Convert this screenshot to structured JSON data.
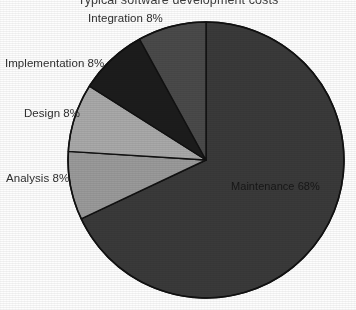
{
  "chart_data": {
    "type": "pie",
    "title": "Typical software development costs",
    "subtitle": "",
    "xlabel": "",
    "ylabel": "",
    "legend_position": "none",
    "grid": false,
    "start_angle_deg": 0,
    "direction": "clockwise",
    "categories": [
      "Maintenance",
      "Analysis",
      "Design",
      "Implementation",
      "Integration"
    ],
    "values": [
      68,
      8,
      8,
      8,
      8
    ],
    "value_unit": "%",
    "total": 100,
    "slices": [
      {
        "label": "Maintenance",
        "value": 68,
        "label_text": "Maintenance 68%",
        "color": "#3a3a3a",
        "label_placement": "inside"
      },
      {
        "label": "Analysis",
        "value": 8,
        "label_text": "Analysis 8%",
        "color": "#9a9a9a",
        "label_placement": "outside"
      },
      {
        "label": "Design",
        "value": 8,
        "label_text": "Design 8%",
        "color": "#a9a9a9",
        "label_placement": "outside"
      },
      {
        "label": "Implementation",
        "value": 8,
        "label_text": "Implementation 8%",
        "color": "#1c1c1c",
        "label_placement": "outside"
      },
      {
        "label": "Integration",
        "value": 8,
        "label_text": "Integration 8%",
        "color": "#4a4a4a",
        "label_placement": "outside"
      }
    ],
    "geometry": {
      "center_x": 206,
      "center_y": 160,
      "radius": 138,
      "clipped_edges": [
        "top",
        "right"
      ]
    },
    "colors": {
      "background": "#fdfdfd",
      "outline": "#111111",
      "title_text": "#3d3d3d",
      "label_text": "#2e2e2e"
    }
  }
}
